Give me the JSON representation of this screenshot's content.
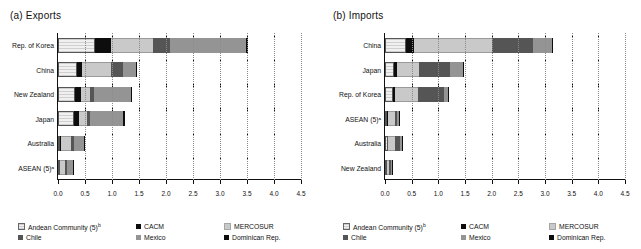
{
  "chart_data": [
    {
      "type": "bar",
      "orientation": "horizontal",
      "stacked": true,
      "title": "(a) Exports",
      "xlabel": "",
      "ylabel": "",
      "xlim": [
        0.0,
        4.5
      ],
      "xticks": [
        "0.0",
        "0.5",
        "1.0",
        "1.5",
        "2.0",
        "2.5",
        "3.0",
        "3.5",
        "4.0",
        "4.5"
      ],
      "grid": true,
      "legend_position": "bottom",
      "categories": [
        "Rep. of Korea",
        "China",
        "New Zealand",
        "Japan",
        "Australia",
        "ASEAN (5)ᵃ"
      ],
      "series": [
        {
          "name": "Andean Community (5)ᵇ",
          "values": [
            0.78,
            0.62,
            0.56,
            0.55,
            0.12,
            0.1
          ]
        },
        {
          "name": "CACM",
          "values": [
            0.32,
            0.15,
            0.22,
            0.2,
            0.04,
            0.03
          ]
        },
        {
          "name": "MERCOSUR",
          "values": [
            0.88,
            0.95,
            0.3,
            0.28,
            0.6,
            0.33
          ]
        },
        {
          "name": "Chile",
          "values": [
            0.37,
            0.38,
            0.12,
            0.1,
            0.12,
            0.15
          ]
        },
        {
          "name": "Mexico",
          "values": [
            1.58,
            0.42,
            1.23,
            1.18,
            0.58,
            0.47
          ]
        },
        {
          "name": "Dominican Rep.",
          "values": [
            0.05,
            0.05,
            0.06,
            0.05,
            0.02,
            0.01
          ]
        }
      ]
    },
    {
      "type": "bar",
      "orientation": "horizontal",
      "stacked": true,
      "title": "(b) Imports",
      "xlabel": "",
      "ylabel": "",
      "xlim": [
        0.0,
        4.5
      ],
      "xticks": [
        "0.0",
        "0.5",
        "1.0",
        "1.5",
        "2.0",
        "2.5",
        "3.0",
        "3.5",
        "4.0",
        "4.5"
      ],
      "grid": true,
      "legend_position": "bottom",
      "categories": [
        "China",
        "Japan",
        "Rep. of Korea",
        "ASEAN (5)ᵃ",
        "Australia",
        "New Zealand"
      ],
      "series": [
        {
          "name": "Andean Community (5)ᵇ",
          "values": [
            0.47,
            0.3,
            0.28,
            0.18,
            0.2,
            0.18
          ]
        },
        {
          "name": "CACM",
          "values": [
            0.17,
            0.1,
            0.09,
            0.02,
            0.02,
            0.02
          ]
        },
        {
          "name": "MERCOSUR",
          "values": [
            1.76,
            0.72,
            0.83,
            0.62,
            0.45,
            0.25
          ]
        },
        {
          "name": "Chile",
          "values": [
            0.92,
            1.02,
            0.95,
            0.12,
            0.35,
            0.22
          ]
        },
        {
          "name": "Mexico",
          "values": [
            0.42,
            0.42,
            0.13,
            0.12,
            0.18,
            0.08
          ]
        },
        {
          "name": "Dominican Rep.",
          "values": [
            0.02,
            0.02,
            0.04,
            0.02,
            0.01,
            0.01
          ]
        }
      ]
    }
  ],
  "legend": {
    "items": [
      {
        "label": "Andean Community (5)",
        "sup": "b",
        "swatch": "andean"
      },
      {
        "label": "CACM",
        "sup": "",
        "swatch": "cacm"
      },
      {
        "label": "MERCOSUR",
        "sup": "",
        "swatch": "mercosur"
      },
      {
        "label": "Chile",
        "sup": "",
        "swatch": "chile"
      },
      {
        "label": "Mexico",
        "sup": "",
        "swatch": "mexico"
      },
      {
        "label": "Dominican Rep.",
        "sup": "",
        "swatch": "dominican"
      }
    ]
  },
  "colors": {
    "andean": "#e2e2e2",
    "cacm": "#0d0d0d",
    "mercosur": "#c9c9c9",
    "chile": "#555555",
    "mexico": "#949494",
    "dominican": "#0d0d0d",
    "axis": "#111111",
    "grid": "#8a8a8a"
  }
}
